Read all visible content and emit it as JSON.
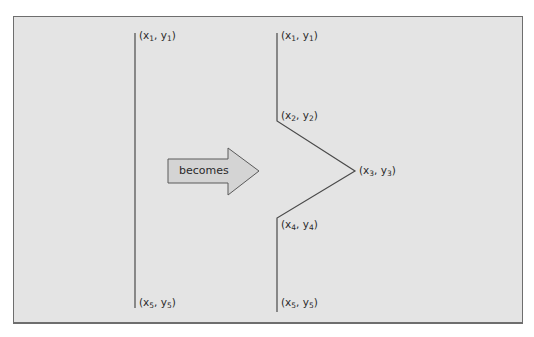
{
  "diagram": {
    "arrow_label": "becomes",
    "left_figure": {
      "points": [
        {
          "id": "p1",
          "x": "x",
          "xs": "1",
          "y": "y",
          "ys": "1"
        },
        {
          "id": "p5",
          "x": "x",
          "xs": "5",
          "y": "y",
          "ys": "5"
        }
      ]
    },
    "right_figure": {
      "points": [
        {
          "id": "p1",
          "x": "x",
          "xs": "1",
          "y": "y",
          "ys": "1"
        },
        {
          "id": "p2",
          "x": "x",
          "xs": "2",
          "y": "y",
          "ys": "2"
        },
        {
          "id": "p3",
          "x": "x",
          "xs": "3",
          "y": "y",
          "ys": "3"
        },
        {
          "id": "p4",
          "x": "x",
          "xs": "4",
          "y": "y",
          "ys": "4"
        },
        {
          "id": "p5",
          "x": "x",
          "xs": "5",
          "y": "y",
          "ys": "5"
        }
      ]
    },
    "colors": {
      "panel_bg": "#e4e4e4",
      "border": "#6e6e6e",
      "line": "#4a4a4a",
      "arrow_fill": "#d4d4d4"
    }
  }
}
